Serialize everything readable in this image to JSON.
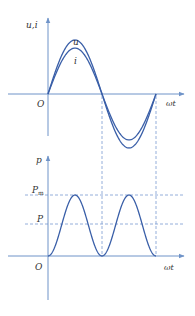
{
  "colors": {
    "axis": "#6f93c8",
    "curve": "#3a5fa8",
    "dashed": "#7a9ad0",
    "text": "#333333",
    "background": "#ffffff"
  },
  "top_plot": {
    "y_axis_label": "u,i",
    "x_axis_label": "ωt",
    "origin_label": "O",
    "curve_labels": {
      "voltage": "u",
      "current": "i"
    }
  },
  "bottom_plot": {
    "y_axis_label": "p",
    "x_axis_label": "ωt",
    "origin_label": "O",
    "level_labels": {
      "max": "P",
      "max_sub": "m",
      "avg": "P"
    }
  },
  "chart_data": [
    {
      "type": "line",
      "title": "",
      "xlabel": "ωt",
      "ylabel": "u,i",
      "x_range": [
        0,
        "2π"
      ],
      "series": [
        {
          "name": "u",
          "shape": "sine",
          "amplitude_relative": 1.0,
          "phase": 0
        },
        {
          "name": "i",
          "shape": "sine",
          "amplitude_relative": 0.85,
          "phase": 0
        }
      ],
      "annotations": [
        "O",
        "u",
        "i"
      ],
      "grid": false
    },
    {
      "type": "line",
      "title": "",
      "xlabel": "ωt",
      "ylabel": "p",
      "x_range": [
        0,
        "2π"
      ],
      "series": [
        {
          "name": "p",
          "shape": "sin²",
          "min": 0,
          "max": "Pm",
          "peaks_at": [
            "π/2",
            "3π/2"
          ],
          "zeros_at": [
            0,
            "π",
            "2π"
          ]
        }
      ],
      "reference_lines": [
        {
          "label": "Pm",
          "value_relative": 1.0,
          "style": "dashed"
        },
        {
          "label": "P",
          "value_relative": 0.5,
          "style": "dashed"
        }
      ],
      "vertical_guides": [
        "π",
        "2π"
      ],
      "annotations": [
        "O",
        "Pm",
        "P"
      ],
      "grid": false
    }
  ]
}
